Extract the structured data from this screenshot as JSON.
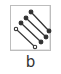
{
  "tool": {
    "label": "b",
    "icon": "parallel-lines-connector-icon",
    "colors": {
      "line": "#333333",
      "border": "#bdbdbd",
      "background": "#ffffff"
    }
  }
}
